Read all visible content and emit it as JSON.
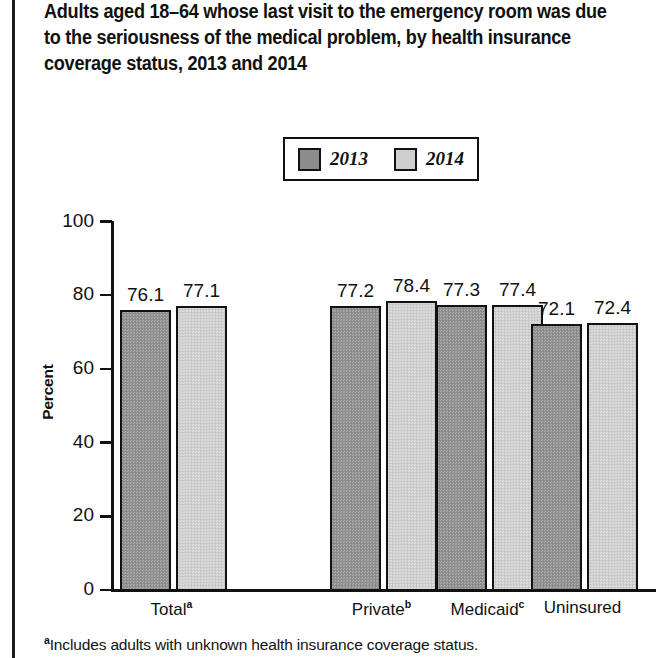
{
  "title": "Adults aged 18–64 whose last visit to the emergency room was due to the seriousness of the medical problem, by health insurance coverage status, 2013 and 2014",
  "legend": {
    "entries": [
      {
        "label": "2013",
        "color": "#8c8c8c"
      },
      {
        "label": "2014",
        "color": "#cfcfcf"
      }
    ]
  },
  "footnote": {
    "marker": "a",
    "text": "Includes adults with unknown health insurance coverage status."
  },
  "chart_data": {
    "type": "bar",
    "title": "Adults aged 18–64 whose last visit to the emergency room was due to the seriousness of the medical problem, by health insurance coverage status, 2013 and 2014",
    "xlabel": "",
    "ylabel": "Percent",
    "ylim": [
      0,
      100
    ],
    "yticks": [
      "0",
      "20",
      "40",
      "60",
      "80",
      "100"
    ],
    "grid": false,
    "legend_position": "top-center",
    "categories": [
      "Total",
      "Private",
      "Medicaid",
      "Uninsured"
    ],
    "category_markers": [
      "a",
      "b",
      "c",
      ""
    ],
    "series": [
      {
        "name": "2013",
        "color": "#8c8c8c",
        "values": [
          76.1,
          77.2,
          77.3,
          72.1
        ]
      },
      {
        "name": "2014",
        "color": "#cfcfcf",
        "values": [
          77.1,
          78.4,
          77.4,
          72.4
        ]
      }
    ],
    "value_labels": [
      [
        "76.1",
        "77.1"
      ],
      [
        "77.2",
        "78.4"
      ],
      [
        "77.3",
        "77.4"
      ],
      [
        "72.1",
        "72.4"
      ]
    ]
  }
}
